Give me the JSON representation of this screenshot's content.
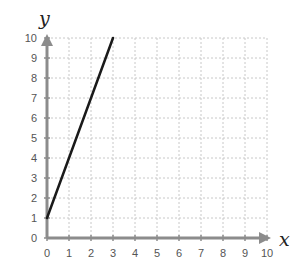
{
  "chart_data": {
    "type": "line",
    "title": "",
    "xlabel": "x",
    "ylabel": "y",
    "xlim": [
      0,
      10
    ],
    "ylim": [
      0,
      10
    ],
    "grid": true,
    "x_ticks": [
      "0",
      "1",
      "2",
      "3",
      "4",
      "5",
      "6",
      "7",
      "8",
      "9",
      "10"
    ],
    "y_ticks": [
      "0",
      "1",
      "2",
      "3",
      "4",
      "5",
      "6",
      "7",
      "8",
      "9",
      "10"
    ],
    "series": [
      {
        "name": "line",
        "x": [
          0,
          3
        ],
        "y": [
          1,
          10
        ],
        "color": "#1a1a1a"
      }
    ]
  },
  "colors": {
    "axis": "#8c8c8c",
    "grid": "#c8c8c8",
    "line": "#1a1a1a"
  }
}
